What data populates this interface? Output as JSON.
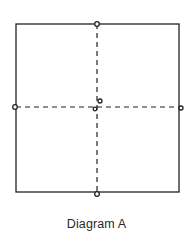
{
  "caption": "Diagram A",
  "colors": {
    "stroke": "#222222",
    "background": "#ffffff"
  },
  "square": {
    "x": 16,
    "y": 24,
    "width": 163,
    "height": 168
  },
  "guides": {
    "vertical": {
      "x": 97,
      "y1": 24,
      "y2": 192,
      "style": "dashed"
    },
    "horizontal": {
      "y": 107,
      "x1": 16,
      "x2": 179,
      "style": "dashed"
    }
  },
  "markers": [
    {
      "name": "top-marker",
      "cx": 97,
      "cy": 24,
      "r": 2.3
    },
    {
      "name": "bottom-marker",
      "cx": 97,
      "cy": 194,
      "r": 2.3
    },
    {
      "name": "left-marker",
      "cx": 15,
      "cy": 107,
      "r": 2.3
    },
    {
      "name": "right-marker",
      "cx": 181,
      "cy": 108,
      "r": 2.0
    },
    {
      "name": "center-marker-upper",
      "cx": 100,
      "cy": 101,
      "r": 2.0
    },
    {
      "name": "center-marker-lower",
      "cx": 95,
      "cy": 109,
      "r": 1.8
    }
  ]
}
